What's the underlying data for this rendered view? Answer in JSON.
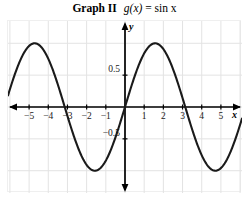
{
  "title": {
    "label": "Graph II",
    "equation_fn": "g(x)",
    "equation_eq": "=",
    "equation_rhs": "sin x",
    "full": "Graph II  g(x) = sin x"
  },
  "axes": {
    "x_name": "x",
    "y_name": "y",
    "x_ticklabels": [
      "−5",
      "−4",
      "−3",
      "−2",
      "−1",
      "1",
      "2",
      "3",
      "4",
      "5"
    ],
    "y_ticklabels": [
      "0.5",
      "−0.5"
    ]
  },
  "colors": {
    "curve": "#1a1a1a",
    "axis": "#000000",
    "grid": "#e3e3e3",
    "background": "#ffffff",
    "text": "#1a1a1a"
  },
  "chart_data": {
    "type": "line",
    "xlabel": "x",
    "ylabel": "y",
    "xlim": [
      -6.1,
      6.1
    ],
    "ylim": [
      -1.35,
      1.35
    ],
    "grid": true,
    "legend": null,
    "xticks": [
      -5,
      -4,
      -3,
      -2,
      -1,
      1,
      2,
      3,
      4,
      5
    ],
    "yticks": [
      0.5,
      -0.5
    ],
    "series": [
      {
        "name": "g(x) = sin x",
        "function": "sin(x)",
        "amplitude": 1,
        "period": 6.283,
        "x": [
          -6.1,
          -5.8,
          -5.5,
          -5.2,
          -4.9,
          -4.712,
          -4.4,
          -4.1,
          -3.8,
          -3.5,
          -3.142,
          -2.8,
          -2.5,
          -2.2,
          -1.9,
          -1.571,
          -1.3,
          -1.0,
          -0.7,
          -0.4,
          0,
          0.4,
          0.7,
          1.0,
          1.3,
          1.571,
          1.9,
          2.2,
          2.5,
          2.8,
          3.142,
          3.5,
          3.8,
          4.1,
          4.4,
          4.712,
          5.0,
          5.3,
          5.6,
          5.9,
          6.1
        ],
        "y": [
          0.175,
          0.465,
          0.706,
          0.883,
          0.982,
          1.0,
          0.952,
          0.818,
          0.612,
          0.351,
          0,
          -0.335,
          -0.599,
          -0.808,
          -0.946,
          -1.0,
          -0.964,
          -0.841,
          -0.644,
          -0.389,
          0,
          0.389,
          0.644,
          0.841,
          0.964,
          1.0,
          0.946,
          0.808,
          0.599,
          0.335,
          0,
          -0.351,
          -0.612,
          -0.818,
          -0.952,
          -1.0,
          -0.959,
          -0.832,
          -0.631,
          -0.374,
          -0.175
        ],
        "zeros": [
          -6.283,
          -3.142,
          0,
          3.142,
          6.283
        ],
        "maxima": [
          {
            "x": -4.712,
            "y": 1
          },
          {
            "x": 1.571,
            "y": 1
          }
        ],
        "minima": [
          {
            "x": -1.571,
            "y": -1
          },
          {
            "x": 4.712,
            "y": -1
          }
        ]
      }
    ]
  }
}
